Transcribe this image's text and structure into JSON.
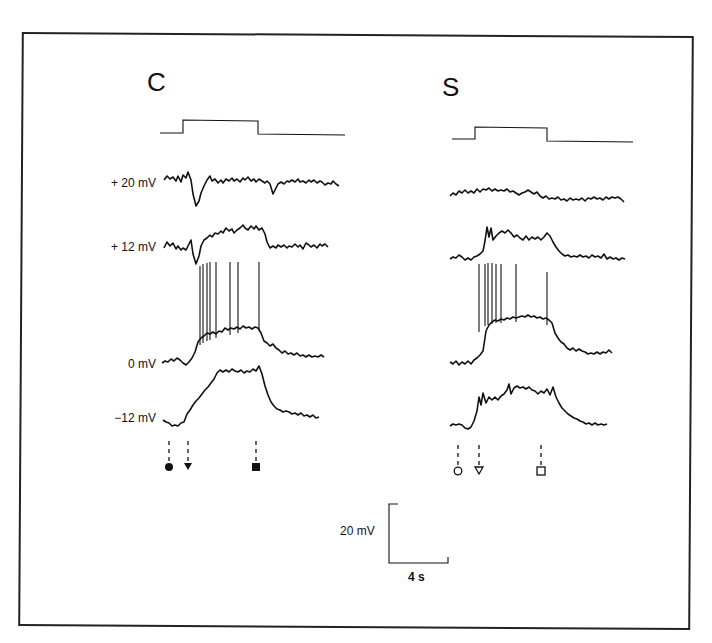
{
  "figure": {
    "panels": [
      {
        "label": "C",
        "marker_style": "filled",
        "markers": [
          "filled-circle",
          "filled-triangle-down",
          "filled-square"
        ],
        "traces": [
          {
            "label": "+ 20 mV"
          },
          {
            "label": "+ 12 mV"
          },
          {
            "label": "0 mV"
          },
          {
            "label": "−12 mV"
          }
        ],
        "spike_count": 8
      },
      {
        "label": "S",
        "marker_style": "open",
        "markers": [
          "open-circle",
          "open-triangle-down",
          "open-square"
        ],
        "traces": [
          {
            "label": ""
          },
          {
            "label": ""
          },
          {
            "label": ""
          },
          {
            "label": ""
          }
        ],
        "spike_count": 8
      }
    ],
    "scale_bar": {
      "vertical": "20 mV",
      "horizontal": "4 s"
    },
    "colors": {
      "ink": "#111111",
      "background": "#ffffff"
    }
  }
}
